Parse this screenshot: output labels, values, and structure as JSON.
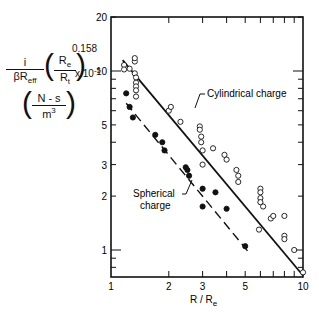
{
  "chart_data": {
    "type": "scatter",
    "title": "",
    "xlabel": "R / R_e",
    "ylabel": "i/(βR_eff) (R_e/R_t)^0.158 x 10^-5 (N-s/m^3)",
    "xscale": "log",
    "yscale": "log",
    "xlim": [
      1,
      10
    ],
    "ylim": [
      0.7,
      20
    ],
    "x_ticks": [
      1,
      2,
      3,
      5,
      10
    ],
    "y_ticks": [
      1,
      2,
      3,
      5,
      10,
      20
    ],
    "grid": false,
    "series": [
      {
        "name": "Cylindrical charge",
        "marker": "open-circle",
        "points": [
          [
            1.17,
            10.8
          ],
          [
            1.17,
            10.2
          ],
          [
            1.25,
            10.3
          ],
          [
            1.33,
            11.3
          ],
          [
            1.33,
            11.8
          ],
          [
            1.33,
            9.7
          ],
          [
            1.35,
            9.2
          ],
          [
            1.35,
            8.6
          ],
          [
            1.35,
            8.2
          ],
          [
            1.35,
            7.8
          ],
          [
            1.35,
            7.2
          ],
          [
            2.0,
            6.0
          ],
          [
            2.05,
            6.3
          ],
          [
            2.3,
            5.2
          ],
          [
            2.9,
            4.9
          ],
          [
            2.9,
            4.7
          ],
          [
            2.95,
            4.3
          ],
          [
            2.95,
            4.0
          ],
          [
            3.0,
            3.6
          ],
          [
            3.0,
            3.0
          ],
          [
            3.4,
            3.7
          ],
          [
            3.9,
            3.4
          ],
          [
            4.0,
            3.2
          ],
          [
            4.5,
            2.8
          ],
          [
            4.6,
            2.6
          ],
          [
            4.6,
            2.4
          ],
          [
            6.0,
            2.2
          ],
          [
            6.0,
            2.1
          ],
          [
            6.0,
            1.95
          ],
          [
            6.0,
            1.85
          ],
          [
            5.9,
            1.3
          ],
          [
            6.2,
            1.75
          ],
          [
            6.8,
            1.5
          ],
          [
            7.0,
            1.55
          ],
          [
            8.0,
            1.55
          ],
          [
            8.0,
            1.2
          ],
          [
            8.0,
            1.15
          ],
          [
            9.0,
            1.0
          ],
          [
            10.0,
            0.75
          ]
        ],
        "fit_line": {
          "style": "solid",
          "from": [
            1.15,
            11.5
          ],
          "to": [
            10.0,
            0.72
          ]
        }
      },
      {
        "name": "Spherical charge",
        "marker": "filled-circle",
        "points": [
          [
            1.2,
            7.5
          ],
          [
            1.25,
            6.3
          ],
          [
            1.3,
            5.5
          ],
          [
            1.7,
            4.4
          ],
          [
            1.85,
            4.0
          ],
          [
            1.9,
            3.6
          ],
          [
            2.45,
            2.9
          ],
          [
            2.5,
            2.8
          ],
          [
            2.55,
            2.6
          ],
          [
            3.0,
            2.2
          ],
          [
            3.0,
            1.75
          ],
          [
            3.5,
            2.1
          ],
          [
            4.0,
            1.7
          ],
          [
            5.0,
            1.05
          ]
        ],
        "fit_line": {
          "style": "dashed",
          "from": [
            1.2,
            6.6
          ],
          "to": [
            5.3,
            0.95
          ]
        }
      }
    ],
    "annotations": [
      {
        "text": "Cylindrical charge",
        "points_to": "solid line"
      },
      {
        "text": "Spherical charge",
        "points_to": "dashed line"
      }
    ]
  },
  "axis": {
    "x_tick_labels": [
      "1",
      "2",
      "3",
      "5",
      "10"
    ],
    "y_tick_labels": [
      "20",
      "10",
      "5",
      "3",
      "2",
      "1"
    ],
    "x_title_main": "R / R",
    "x_title_sub": "e"
  },
  "ylabel": {
    "numerator": "i",
    "denominator_main": "βR",
    "denominator_sub": "eff",
    "ratio_num_main": "R",
    "ratio_num_sub": "e",
    "ratio_den_main": "R",
    "ratio_den_sub": "t",
    "exponent": "0.158",
    "times": "x 10",
    "times_exp": "-5",
    "units_num": "N - s",
    "units_den_main": "m",
    "units_den_exp": "3"
  },
  "annotations": {
    "cylindrical": "Cylindrical charge",
    "spherical_line1": "Spherical",
    "spherical_line2": "charge"
  }
}
